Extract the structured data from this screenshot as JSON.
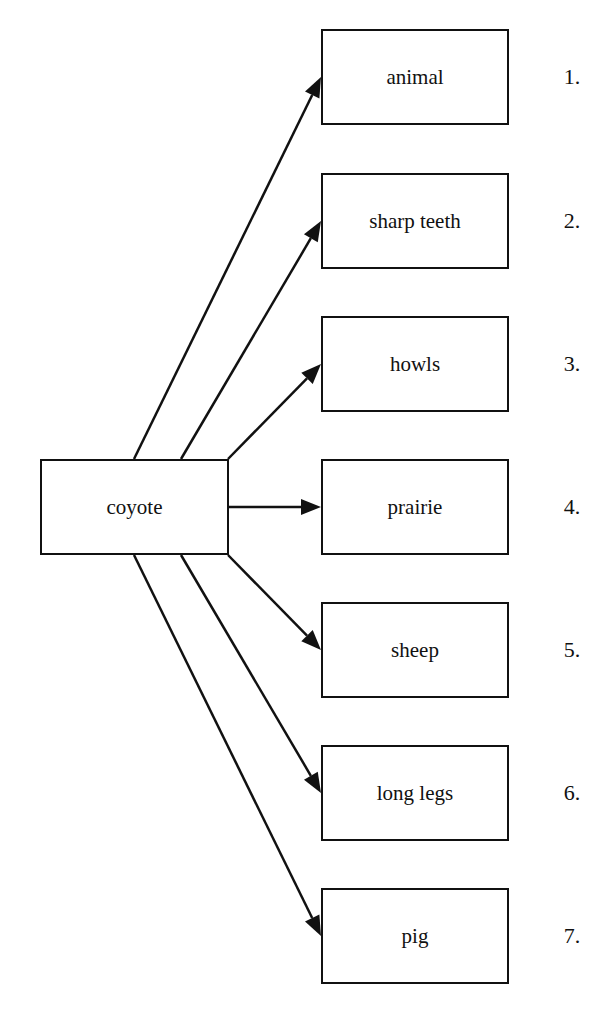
{
  "diagram": {
    "type": "concept-map",
    "source": {
      "label": "coyote",
      "box": {
        "x": 40,
        "y": 459,
        "w": 189,
        "h": 96
      }
    },
    "target_box": {
      "x": 321,
      "w": 188,
      "h": 96
    },
    "number_x": 572,
    "line_color": "#111111",
    "targets": [
      {
        "label": "animal",
        "number": "1.",
        "y": 29,
        "from": [
          134,
          459
        ]
      },
      {
        "label": "sharp teeth",
        "number": "2.",
        "y": 173,
        "from": [
          181,
          459
        ]
      },
      {
        "label": "howls",
        "number": "3.",
        "y": 316,
        "from": [
          228,
          459
        ]
      },
      {
        "label": "prairie",
        "number": "4.",
        "y": 459,
        "from": [
          228,
          507
        ]
      },
      {
        "label": "sheep",
        "number": "5.",
        "y": 602,
        "from": [
          228,
          555
        ]
      },
      {
        "label": "long legs",
        "number": "6.",
        "y": 745,
        "from": [
          181,
          555
        ]
      },
      {
        "label": "pig",
        "number": "7.",
        "y": 888,
        "from": [
          134,
          555
        ]
      }
    ]
  }
}
